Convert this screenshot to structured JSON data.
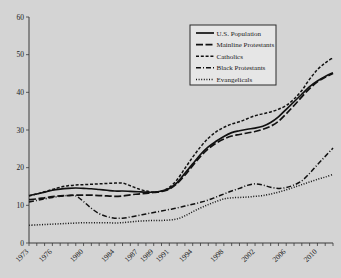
{
  "chart_data": {
    "type": "line",
    "title": "",
    "xlabel": "",
    "ylabel": "",
    "xlim": [
      1973,
      2012
    ],
    "ylim": [
      0,
      60
    ],
    "yticks": [
      0,
      10,
      20,
      30,
      40,
      50,
      60
    ],
    "xticks": [
      1973,
      1976,
      1980,
      1984,
      1987,
      1989,
      1991,
      1994,
      1998,
      2002,
      2006,
      2010
    ],
    "grid": false,
    "legend_position": "top-right",
    "x": [
      1973,
      1974,
      1975,
      1976,
      1977,
      1978,
      1979,
      1980,
      1981,
      1982,
      1983,
      1984,
      1985,
      1986,
      1987,
      1988,
      1989,
      1990,
      1991,
      1992,
      1993,
      1994,
      1995,
      1996,
      1997,
      1998,
      1999,
      2000,
      2001,
      2002,
      2003,
      2004,
      2005,
      2006,
      2007,
      2008,
      2009,
      2010,
      2011,
      2012
    ],
    "series": [
      {
        "name": "U.S. Population",
        "style": "solid",
        "values": [
          12.6,
          13.0,
          13.5,
          14.0,
          14.3,
          14.5,
          14.6,
          14.5,
          14.4,
          14.2,
          14.0,
          13.8,
          13.8,
          13.7,
          13.6,
          13.5,
          13.5,
          13.8,
          14.5,
          16.0,
          18.5,
          21.0,
          23.5,
          25.5,
          27.0,
          28.3,
          29.3,
          29.8,
          30.2,
          30.5,
          31.0,
          32.0,
          33.5,
          35.5,
          37.5,
          39.5,
          41.5,
          43.0,
          44.2,
          45.2
        ]
      },
      {
        "name": "Mainline Protestants",
        "style": "long-dash",
        "values": [
          11.5,
          11.7,
          12.0,
          12.3,
          12.5,
          12.6,
          12.7,
          12.7,
          12.7,
          12.6,
          12.5,
          12.4,
          12.5,
          12.8,
          13.0,
          13.2,
          13.4,
          13.7,
          14.3,
          15.8,
          18.0,
          20.5,
          23.0,
          25.0,
          26.5,
          27.6,
          28.4,
          28.8,
          29.2,
          29.6,
          30.2,
          31.0,
          32.3,
          34.3,
          36.5,
          38.8,
          41.0,
          42.8,
          44.0,
          45.0
        ]
      },
      {
        "name": "Catholics",
        "style": "dashed",
        "values": [
          12.5,
          13.0,
          13.6,
          14.2,
          14.8,
          15.2,
          15.4,
          15.5,
          15.6,
          15.7,
          15.8,
          15.9,
          15.9,
          15.2,
          14.4,
          13.8,
          13.5,
          13.8,
          14.8,
          16.8,
          19.8,
          22.8,
          25.5,
          27.8,
          29.5,
          30.7,
          31.6,
          32.2,
          33.0,
          33.8,
          34.3,
          34.8,
          35.5,
          36.5,
          38.2,
          40.5,
          43.5,
          46.0,
          47.8,
          49.2
        ]
      },
      {
        "name": "Black Protestants",
        "style": "dash-dot",
        "values": [
          10.9,
          11.3,
          11.7,
          12.1,
          12.4,
          12.6,
          12.5,
          11.0,
          9.2,
          7.8,
          7.0,
          6.6,
          6.6,
          6.9,
          7.3,
          7.7,
          8.1,
          8.5,
          8.9,
          9.3,
          9.8,
          10.3,
          10.8,
          11.4,
          12.2,
          13.0,
          13.8,
          14.5,
          15.3,
          15.7,
          15.4,
          14.8,
          14.5,
          14.7,
          15.4,
          16.5,
          18.5,
          20.8,
          23.0,
          25.2
        ]
      },
      {
        "name": "Evangelicals",
        "style": "dotted",
        "values": [
          4.7,
          4.8,
          4.9,
          5.0,
          5.1,
          5.2,
          5.3,
          5.4,
          5.4,
          5.4,
          5.4,
          5.3,
          5.4,
          5.6,
          5.8,
          5.9,
          6.0,
          6.0,
          6.1,
          6.4,
          7.2,
          8.3,
          9.3,
          10.2,
          11.0,
          11.7,
          12.0,
          12.1,
          12.2,
          12.4,
          12.6,
          13.0,
          13.5,
          14.1,
          14.8,
          15.5,
          16.2,
          16.9,
          17.5,
          18.2
        ]
      }
    ]
  },
  "legend": {
    "items": [
      {
        "label": "U.S. Population",
        "style": "solid"
      },
      {
        "label": "Mainline Protestants",
        "style": "long-dash"
      },
      {
        "label": "Catholics",
        "style": "dashed"
      },
      {
        "label": "Black Protestants",
        "style": "dash-dot"
      },
      {
        "label": "Evangelicals",
        "style": "dotted"
      }
    ]
  },
  "colors": {
    "background": "#d4d4d4",
    "line": "#111111",
    "axis": "#3a3a3a",
    "legend_fill": "#e6e6e6"
  }
}
